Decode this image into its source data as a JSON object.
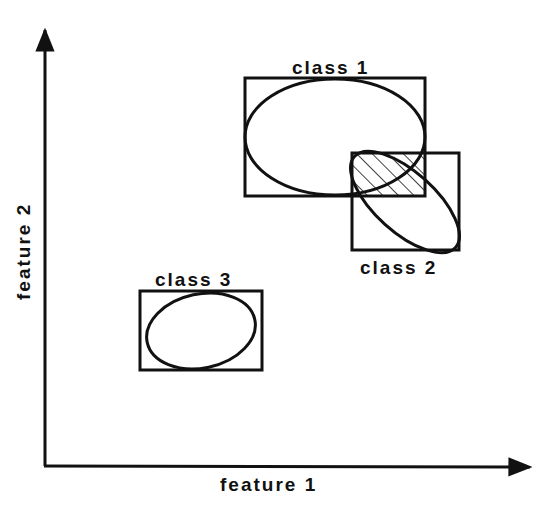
{
  "diagram": {
    "axes": {
      "x_label": "feature 1",
      "y_label": "feature 2"
    },
    "classes": [
      {
        "label": "class 1",
        "box": {
          "x": 245,
          "y": 78,
          "w": 180,
          "h": 118
        },
        "ellipse": {
          "cx": 335,
          "cy": 137,
          "rx": 90,
          "ry": 58,
          "rotate": 0
        }
      },
      {
        "label": "class 2",
        "box": {
          "x": 352,
          "y": 153,
          "w": 107,
          "h": 97
        },
        "ellipse": {
          "cx": 405,
          "cy": 202,
          "rx": 66,
          "ry": 30,
          "rotate": 42
        }
      },
      {
        "label": "class 3",
        "box": {
          "x": 140,
          "y": 291,
          "w": 122,
          "h": 79
        },
        "ellipse": {
          "cx": 200,
          "cy": 331,
          "rx": 55,
          "ry": 37,
          "rotate": -12
        }
      }
    ],
    "overlap_region": {
      "x": 352,
      "y": 153,
      "w": 73,
      "h": 43,
      "fill": "hatched"
    },
    "colors": {
      "ink": "#111111",
      "background": "#ffffff"
    }
  }
}
